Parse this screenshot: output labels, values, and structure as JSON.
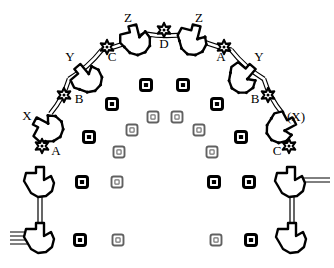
{
  "figure": {
    "background_color": "#ffffff",
    "ink_color": "#000000",
    "width": 334,
    "height": 268
  },
  "labels": [
    {
      "id": "label-z-left",
      "text": "Z",
      "x": 128,
      "y": 19
    },
    {
      "id": "label-z-right",
      "text": "Z",
      "x": 199,
      "y": 19
    },
    {
      "id": "label-d",
      "text": "D",
      "x": 164,
      "y": 45
    },
    {
      "id": "label-c-left",
      "text": "C",
      "x": 112,
      "y": 58
    },
    {
      "id": "label-a-top-right",
      "text": "A",
      "x": 221,
      "y": 58
    },
    {
      "id": "label-y-left",
      "text": "Y",
      "x": 70,
      "y": 58
    },
    {
      "id": "label-y-right",
      "text": "Y",
      "x": 259,
      "y": 58
    },
    {
      "id": "label-b-left",
      "text": "B",
      "x": 79,
      "y": 100
    },
    {
      "id": "label-b-right",
      "text": "B",
      "x": 255,
      "y": 100
    },
    {
      "id": "label-x-left",
      "text": "X",
      "x": 27,
      "y": 117
    },
    {
      "id": "label-x-right",
      "text": "(X)",
      "x": 296,
      "y": 118
    },
    {
      "id": "label-a-left",
      "text": "A",
      "x": 56,
      "y": 152
    },
    {
      "id": "label-c-right",
      "text": "C",
      "x": 277,
      "y": 152
    }
  ],
  "markers": {
    "name": "interior-square-markers",
    "count": 24,
    "items": [
      {
        "x": 146,
        "y": 85,
        "fill": "solid"
      },
      {
        "x": 183,
        "y": 85,
        "fill": "solid"
      },
      {
        "x": 112,
        "y": 104,
        "fill": "solid"
      },
      {
        "x": 217,
        "y": 104,
        "fill": "solid"
      },
      {
        "x": 153,
        "y": 117,
        "fill": "open"
      },
      {
        "x": 177,
        "y": 117,
        "fill": "open"
      },
      {
        "x": 132,
        "y": 130,
        "fill": "open"
      },
      {
        "x": 199,
        "y": 130,
        "fill": "open"
      },
      {
        "x": 89,
        "y": 137,
        "fill": "solid"
      },
      {
        "x": 241,
        "y": 137,
        "fill": "solid"
      },
      {
        "x": 119,
        "y": 152,
        "fill": "open"
      },
      {
        "x": 212,
        "y": 152,
        "fill": "open"
      },
      {
        "x": 82,
        "y": 182,
        "fill": "solid"
      },
      {
        "x": 117,
        "y": 182,
        "fill": "open"
      },
      {
        "x": 214,
        "y": 182,
        "fill": "solid"
      },
      {
        "x": 249,
        "y": 182,
        "fill": "solid"
      },
      {
        "x": 80,
        "y": 240,
        "fill": "solid"
      },
      {
        "x": 118,
        "y": 240,
        "fill": "open"
      },
      {
        "x": 216,
        "y": 240,
        "fill": "open"
      },
      {
        "x": 251,
        "y": 240,
        "fill": "solid"
      }
    ]
  },
  "subunits": {
    "name": "arch-subunits",
    "description": "Irregular arrow/blob shaped protein-like subunits arranged along the arch.",
    "items": [
      {
        "id": "subunit-x-left",
        "x": 48,
        "y": 128,
        "rot": -62
      },
      {
        "id": "subunit-y-left",
        "x": 87,
        "y": 78,
        "rot": -40
      },
      {
        "id": "subunit-z-left",
        "x": 136,
        "y": 40,
        "rot": -14
      },
      {
        "id": "subunit-z-right",
        "x": 193,
        "y": 40,
        "rot": 14
      },
      {
        "id": "subunit-y-right",
        "x": 243,
        "y": 78,
        "rot": 40
      },
      {
        "id": "subunit-x-right",
        "x": 281,
        "y": 128,
        "rot": 62
      },
      {
        "id": "subunit-base-left",
        "x": 40,
        "y": 182,
        "rot": 0
      },
      {
        "id": "subunit-base-right",
        "x": 291,
        "y": 182,
        "rot": 0
      },
      {
        "id": "subunit-foot-left",
        "x": 40,
        "y": 238,
        "rot": 0
      },
      {
        "id": "subunit-foot-right",
        "x": 292,
        "y": 238,
        "rot": 0
      }
    ]
  },
  "nodes": {
    "name": "arch-joint-nodes",
    "description": "Small star/cog shaped junction nodes connecting adjacent subunits.",
    "items": [
      {
        "id": "node-a-left",
        "x": 42,
        "y": 146
      },
      {
        "id": "node-b-left",
        "x": 64,
        "y": 95
      },
      {
        "id": "node-c-left",
        "x": 107,
        "y": 47
      },
      {
        "id": "node-d",
        "x": 164,
        "y": 30
      },
      {
        "id": "node-a-right",
        "x": 224,
        "y": 47
      },
      {
        "id": "node-b-right",
        "x": 268,
        "y": 95
      },
      {
        "id": "node-c-right",
        "x": 289,
        "y": 146
      }
    ]
  }
}
